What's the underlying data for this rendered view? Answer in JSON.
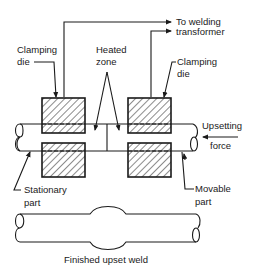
{
  "diagram": {
    "labels": {
      "to_welding_line1": "To welding",
      "to_welding_line2": "transformer",
      "clamping_die_left_line1": "Clamping",
      "clamping_die_left_line2": "die",
      "heated_zone_line1": "Heated",
      "heated_zone_line2": "zone",
      "clamping_die_right_line1": "Clamping",
      "clamping_die_right_line2": "die",
      "upsetting_force_line1": "Upsetting",
      "upsetting_force_line2": "force",
      "stationary_part_line1": "Stationary",
      "stationary_part_line2": "part",
      "movable_part_line1": "Movable",
      "movable_part_line2": "part",
      "caption": "Finished upset weld"
    },
    "colors": {
      "line": "#1a1a1a",
      "background": "#ffffff"
    }
  }
}
